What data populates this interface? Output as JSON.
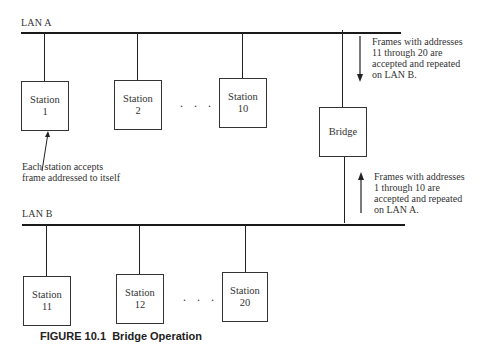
{
  "lan_a": {
    "label": "LAN A",
    "stations": [
      {
        "name": "Station",
        "number": "1"
      },
      {
        "name": "Station",
        "number": "2"
      },
      {
        "name": "Station",
        "number": "10"
      }
    ],
    "ellipsis": ". . ."
  },
  "lan_b": {
    "label": "LAN B",
    "stations": [
      {
        "name": "Station",
        "number": "11"
      },
      {
        "name": "Station",
        "number": "12"
      },
      {
        "name": "Station",
        "number": "20"
      }
    ],
    "ellipsis": ". . ."
  },
  "bridge": {
    "label": "Bridge"
  },
  "notes": {
    "station_accepts": [
      "Each station accepts",
      "frame addressed to itself"
    ],
    "a_to_b": [
      "Frames with addresses",
      "11 through 20 are",
      "accepted and repeated",
      "on LAN B."
    ],
    "b_to_a": [
      "Frames with addresses",
      "1 through 10 are",
      "accepted and repeated",
      "on LAN A."
    ]
  },
  "caption": {
    "figure": "FIGURE 10.1",
    "title": "Bridge Operation"
  }
}
